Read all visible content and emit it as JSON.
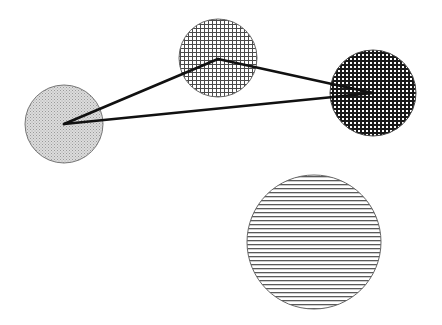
{
  "canvas": {
    "width": 442,
    "height": 325,
    "background": "#ffffff"
  },
  "circles": [
    {
      "id": "A",
      "cx": 64,
      "cy": 124,
      "r": 39,
      "pattern": "stipple",
      "fill": "#d8d8d8",
      "ink": "#8a8a8a",
      "stroke": "#777777"
    },
    {
      "id": "B",
      "cx": 218,
      "cy": 58,
      "r": 39,
      "pattern": "grid",
      "fill": "#ffffff",
      "ink": "#4a4a4a",
      "stroke": "#666666"
    },
    {
      "id": "C",
      "cx": 373,
      "cy": 93,
      "r": 43,
      "pattern": "dense-grid",
      "fill": "#ffffff",
      "ink": "#1a1a1a",
      "stroke": "#444444"
    },
    {
      "id": "D",
      "cx": 314,
      "cy": 242,
      "r": 67,
      "pattern": "hlines",
      "fill": "#ffffff",
      "ink": "#5a5a5a",
      "stroke": "#666666"
    }
  ],
  "edges": [
    {
      "from": "A",
      "to": "B",
      "x1": 64,
      "y1": 124,
      "x2": 218,
      "y2": 59
    },
    {
      "from": "B",
      "to": "C",
      "x1": 218,
      "y1": 59,
      "x2": 373,
      "y2": 93
    },
    {
      "from": "C",
      "to": "A",
      "x1": 373,
      "y1": 93,
      "x2": 64,
      "y2": 124
    }
  ],
  "edge_style": {
    "color": "#111111",
    "width": 2.6
  }
}
